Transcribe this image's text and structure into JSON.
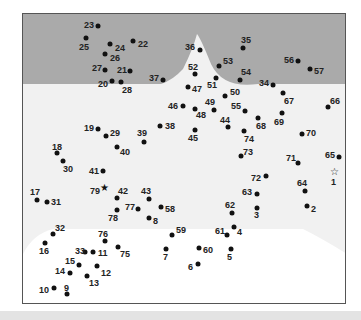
{
  "puzzle": {
    "type": "connect-the-dots",
    "total_points": 79,
    "start_marker": "star-outline at 1",
    "end_marker": "star-filled at 79",
    "colors": {
      "sky": "#aaaaaa",
      "ground": "#f0f0f0",
      "lower": "#ffffff",
      "dot": "#111111",
      "border": "#555555"
    },
    "points": [
      {
        "n": "1",
        "x": 333,
        "y": 171,
        "lx": 330,
        "ly": 177,
        "shape": "star-open"
      },
      {
        "n": "2",
        "x": 306,
        "y": 205,
        "lx": 310,
        "ly": 204
      },
      {
        "n": "3",
        "x": 256,
        "y": 207,
        "lx": 253,
        "ly": 210
      },
      {
        "n": "4",
        "x": 233,
        "y": 226,
        "lx": 236,
        "ly": 227
      },
      {
        "n": "5",
        "x": 230,
        "y": 248,
        "lx": 226,
        "ly": 252
      },
      {
        "n": "6",
        "x": 197,
        "y": 263,
        "lx": 187,
        "ly": 262
      },
      {
        "n": "7",
        "x": 165,
        "y": 248,
        "lx": 162,
        "ly": 252
      },
      {
        "n": "8",
        "x": 148,
        "y": 217,
        "lx": 152,
        "ly": 216
      },
      {
        "n": "9",
        "x": 66,
        "y": 293,
        "lx": 63,
        "ly": 283
      },
      {
        "n": "10",
        "x": 53,
        "y": 287,
        "lx": 38,
        "ly": 285
      },
      {
        "n": "11",
        "x": 92,
        "y": 251,
        "lx": 97,
        "ly": 248
      },
      {
        "n": "12",
        "x": 96,
        "y": 265,
        "lx": 100,
        "ly": 268
      },
      {
        "n": "13",
        "x": 86,
        "y": 275,
        "lx": 88,
        "ly": 278
      },
      {
        "n": "14",
        "x": 69,
        "y": 272,
        "lx": 54,
        "ly": 266
      },
      {
        "n": "15",
        "x": 78,
        "y": 264,
        "lx": 64,
        "ly": 256
      },
      {
        "n": "16",
        "x": 44,
        "y": 242,
        "lx": 38,
        "ly": 246
      },
      {
        "n": "17",
        "x": 36,
        "y": 199,
        "lx": 29,
        "ly": 187
      },
      {
        "n": "18",
        "x": 56,
        "y": 152,
        "lx": 51,
        "ly": 142
      },
      {
        "n": "19",
        "x": 97,
        "y": 128,
        "lx": 83,
        "ly": 123
      },
      {
        "n": "20",
        "x": 111,
        "y": 80,
        "lx": 97,
        "ly": 79
      },
      {
        "n": "21",
        "x": 129,
        "y": 70,
        "lx": 116,
        "ly": 65
      },
      {
        "n": "22",
        "x": 132,
        "y": 40,
        "lx": 137,
        "ly": 39
      },
      {
        "n": "23",
        "x": 97,
        "y": 25,
        "lx": 83,
        "ly": 20
      },
      {
        "n": "24",
        "x": 109,
        "y": 43,
        "lx": 114,
        "ly": 43
      },
      {
        "n": "25",
        "x": 85,
        "y": 37,
        "lx": 78,
        "ly": 42
      },
      {
        "n": "26",
        "x": 104,
        "y": 53,
        "lx": 109,
        "ly": 53
      },
      {
        "n": "27",
        "x": 104,
        "y": 69,
        "lx": 91,
        "ly": 63
      },
      {
        "n": "28",
        "x": 120,
        "y": 81,
        "lx": 121,
        "ly": 85
      },
      {
        "n": "29",
        "x": 105,
        "y": 135,
        "lx": 109,
        "ly": 128
      },
      {
        "n": "30",
        "x": 62,
        "y": 160,
        "lx": 62,
        "ly": 164
      },
      {
        "n": "31",
        "x": 46,
        "y": 201,
        "lx": 50,
        "ly": 197
      },
      {
        "n": "32",
        "x": 52,
        "y": 233,
        "lx": 54,
        "ly": 223
      },
      {
        "n": "33",
        "x": 84,
        "y": 251,
        "lx": 74,
        "ly": 246
      },
      {
        "n": "34",
        "x": 272,
        "y": 84,
        "lx": 258,
        "ly": 78
      },
      {
        "n": "35",
        "x": 242,
        "y": 47,
        "lx": 240,
        "ly": 35
      },
      {
        "n": "36",
        "x": 199,
        "y": 49,
        "lx": 184,
        "ly": 42
      },
      {
        "n": "37",
        "x": 162,
        "y": 79,
        "lx": 148,
        "ly": 73
      },
      {
        "n": "38",
        "x": 159,
        "y": 125,
        "lx": 164,
        "ly": 121
      },
      {
        "n": "39",
        "x": 143,
        "y": 141,
        "lx": 136,
        "ly": 128
      },
      {
        "n": "40",
        "x": 116,
        "y": 146,
        "lx": 119,
        "ly": 147
      },
      {
        "n": "41",
        "x": 102,
        "y": 170,
        "lx": 88,
        "ly": 166
      },
      {
        "n": "42",
        "x": 116,
        "y": 197,
        "lx": 117,
        "ly": 186
      },
      {
        "n": "43",
        "x": 148,
        "y": 198,
        "lx": 140,
        "ly": 186
      },
      {
        "n": "44",
        "x": 227,
        "y": 126,
        "lx": 219,
        "ly": 115
      },
      {
        "n": "45",
        "x": 194,
        "y": 129,
        "lx": 187,
        "ly": 133
      },
      {
        "n": "46",
        "x": 182,
        "y": 105,
        "lx": 167,
        "ly": 101
      },
      {
        "n": "47",
        "x": 187,
        "y": 86,
        "lx": 191,
        "ly": 84
      },
      {
        "n": "48",
        "x": 194,
        "y": 108,
        "lx": 195,
        "ly": 110
      },
      {
        "n": "49",
        "x": 213,
        "y": 109,
        "lx": 204,
        "ly": 97
      },
      {
        "n": "50",
        "x": 224,
        "y": 95,
        "lx": 229,
        "ly": 87
      },
      {
        "n": "51",
        "x": 215,
        "y": 77,
        "lx": 206,
        "ly": 80
      },
      {
        "n": "52",
        "x": 194,
        "y": 73,
        "lx": 187,
        "ly": 62
      },
      {
        "n": "53",
        "x": 218,
        "y": 65,
        "lx": 222,
        "ly": 56
      },
      {
        "n": "54",
        "x": 239,
        "y": 79,
        "lx": 240,
        "ly": 67
      },
      {
        "n": "55",
        "x": 244,
        "y": 110,
        "lx": 230,
        "ly": 101
      },
      {
        "n": "56",
        "x": 297,
        "y": 60,
        "lx": 283,
        "ly": 55
      },
      {
        "n": "57",
        "x": 309,
        "y": 68,
        "lx": 313,
        "ly": 66
      },
      {
        "n": "58",
        "x": 160,
        "y": 206,
        "lx": 164,
        "ly": 204
      },
      {
        "n": "59",
        "x": 171,
        "y": 234,
        "lx": 175,
        "ly": 225
      },
      {
        "n": "60",
        "x": 198,
        "y": 247,
        "lx": 202,
        "ly": 245
      },
      {
        "n": "61",
        "x": 226,
        "y": 234,
        "lx": 214,
        "ly": 226
      },
      {
        "n": "62",
        "x": 231,
        "y": 212,
        "lx": 224,
        "ly": 200
      },
      {
        "n": "63",
        "x": 256,
        "y": 193,
        "lx": 241,
        "ly": 187
      },
      {
        "n": "64",
        "x": 304,
        "y": 190,
        "lx": 296,
        "ly": 178
      },
      {
        "n": "65",
        "x": 338,
        "y": 156,
        "lx": 324,
        "ly": 150
      },
      {
        "n": "66",
        "x": 327,
        "y": 106,
        "lx": 329,
        "ly": 96
      },
      {
        "n": "67",
        "x": 282,
        "y": 92,
        "lx": 283,
        "ly": 96
      },
      {
        "n": "68",
        "x": 257,
        "y": 117,
        "lx": 255,
        "ly": 121
      },
      {
        "n": "69",
        "x": 281,
        "y": 112,
        "lx": 273,
        "ly": 117
      },
      {
        "n": "70",
        "x": 301,
        "y": 133,
        "lx": 305,
        "ly": 128
      },
      {
        "n": "71",
        "x": 297,
        "y": 162,
        "lx": 285,
        "ly": 153
      },
      {
        "n": "72",
        "x": 265,
        "y": 175,
        "lx": 250,
        "ly": 173
      },
      {
        "n": "73",
        "x": 240,
        "y": 155,
        "lx": 242,
        "ly": 147
      },
      {
        "n": "74",
        "x": 243,
        "y": 130,
        "lx": 243,
        "ly": 134
      },
      {
        "n": "75",
        "x": 117,
        "y": 246,
        "lx": 119,
        "ly": 249
      },
      {
        "n": "76",
        "x": 104,
        "y": 240,
        "lx": 97,
        "ly": 229
      },
      {
        "n": "77",
        "x": 137,
        "y": 208,
        "lx": 124,
        "ly": 202
      },
      {
        "n": "78",
        "x": 116,
        "y": 209,
        "lx": 107,
        "ly": 213
      },
      {
        "n": "79",
        "x": 103,
        "y": 187,
        "lx": 89,
        "ly": 186,
        "shape": "star-filled"
      }
    ]
  }
}
